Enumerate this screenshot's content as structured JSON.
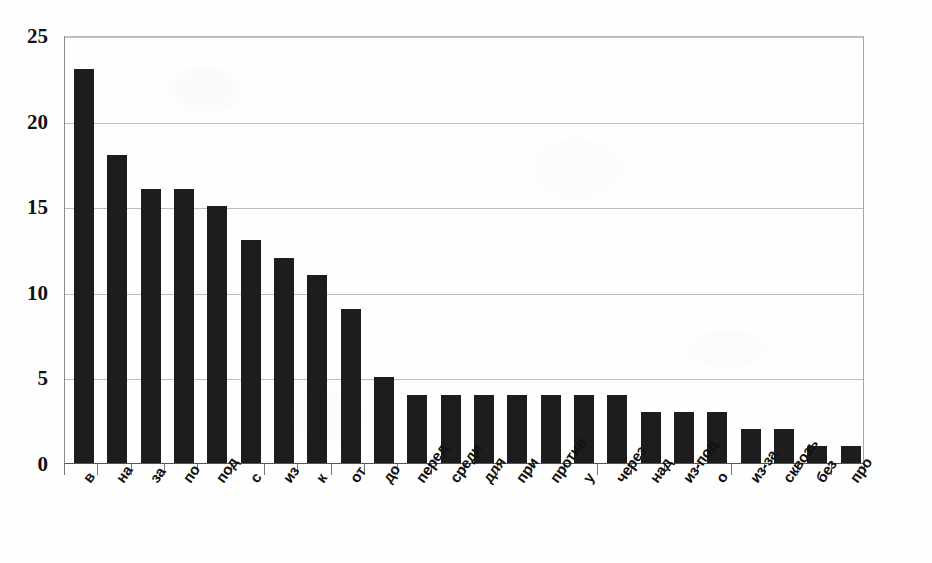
{
  "chart_data": {
    "type": "bar",
    "title": "",
    "subtitle": "",
    "xlabel": "",
    "ylabel": "",
    "ylim": [
      0,
      25
    ],
    "yticks": [
      0,
      5,
      10,
      15,
      20,
      25
    ],
    "ytick_labels": [
      "0",
      "5",
      "10",
      "15",
      "20",
      "25"
    ],
    "grid": true,
    "legend": false,
    "legend_position": "none",
    "orientation": "vertical",
    "bar_color": "#1d1d1d",
    "categories": [
      "в",
      "на",
      "за",
      "по",
      "под",
      "с",
      "из",
      "к",
      "от",
      "до",
      "перед",
      "среди",
      "для",
      "при",
      "против",
      "у",
      "через",
      "над",
      "из-под",
      "о",
      "из-за",
      "сквозь",
      "без",
      "про"
    ],
    "values": [
      23,
      18,
      16,
      16,
      15,
      13,
      12,
      11,
      9,
      5,
      4,
      4,
      4,
      4,
      4,
      4,
      4,
      3,
      3,
      3,
      2,
      2,
      1,
      1
    ]
  },
  "colors": {
    "bar": "#1d1d1d",
    "gridline": "#bdbdbd",
    "axis": "#555555",
    "text": "#111111",
    "background": "#fefefe"
  }
}
